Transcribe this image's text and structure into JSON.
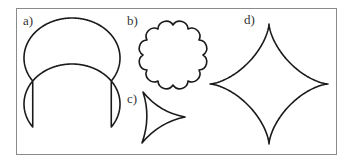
{
  "figure": {
    "frame": {
      "x": 16,
      "y": 8,
      "width": 321,
      "height": 147,
      "color": "#8a8a8a"
    },
    "stroke_color": "#1a1a1a",
    "panels": [
      {
        "id": "a",
        "label": "a)",
        "label_pos": {
          "x": 23,
          "y": 14
        },
        "shape": "double-circle",
        "params": {
          "cx": 72,
          "cy_top": 58,
          "cy_bottom": 104,
          "rx": 48,
          "ry": 40
        }
      },
      {
        "id": "b",
        "label": "b)",
        "label_pos": {
          "x": 127,
          "y": 14
        },
        "shape": "scalloped-circle",
        "params": {
          "cx": 173,
          "cy": 55,
          "r": 30,
          "lobes": 12,
          "lobe_depth": 3.6
        }
      },
      {
        "id": "c",
        "label": "c)",
        "label_pos": {
          "x": 127,
          "y": 92
        },
        "shape": "deltoid",
        "params": {
          "vertices": [
            [
              143,
              92
            ],
            [
              185,
              117
            ],
            [
              142,
              143
            ]
          ],
          "bow": 0.28
        }
      },
      {
        "id": "d",
        "label": "d)",
        "label_pos": {
          "x": 244,
          "y": 13
        },
        "shape": "astroid",
        "params": {
          "cx": 269,
          "cy": 84,
          "rx": 59,
          "ry": 60
        }
      }
    ]
  }
}
